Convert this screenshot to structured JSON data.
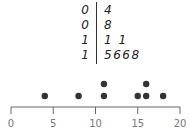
{
  "chart_data": [
    {
      "type": "table",
      "title": "Stem-and-leaf plot",
      "rows": [
        {
          "stem": "0",
          "leaves": "4"
        },
        {
          "stem": "0",
          "leaves": "8"
        },
        {
          "stem": "1",
          "leaves": "1 1"
        },
        {
          "stem": "1",
          "leaves": "5668"
        }
      ],
      "values": [
        4,
        8,
        11,
        11,
        15,
        16,
        16,
        18
      ]
    },
    {
      "type": "scatter",
      "title": "Dot plot",
      "xlabel": "",
      "ylabel": "",
      "xlim": [
        0,
        20
      ],
      "xticks": [
        0,
        5,
        10,
        15,
        20
      ],
      "tick_labels": [
        "0",
        "5",
        "10",
        "15",
        "20"
      ],
      "points": [
        {
          "x": 4,
          "count": 1
        },
        {
          "x": 8,
          "count": 1
        },
        {
          "x": 11,
          "count": 2
        },
        {
          "x": 15,
          "count": 1
        },
        {
          "x": 16,
          "count": 2
        },
        {
          "x": 18,
          "count": 1
        }
      ],
      "grid": false,
      "dot_color": "#333333",
      "axis_color": "#666666"
    }
  ]
}
